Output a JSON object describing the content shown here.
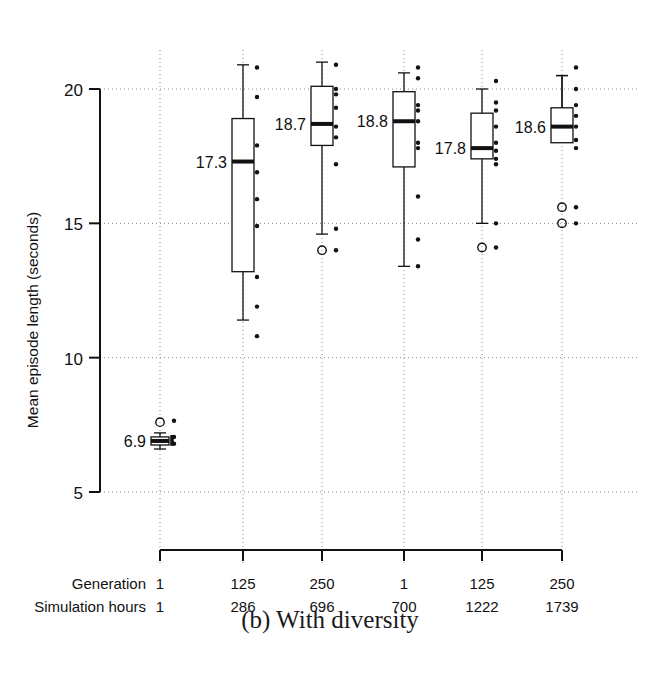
{
  "figure": {
    "caption": "(b) With diversity",
    "ylabel": "Mean episode length (seconds)",
    "row_labels": {
      "generation": "Generation",
      "sim_hours": "Simulation hours"
    },
    "colors": {
      "ink": "#111111",
      "grid": "#8c8c8c",
      "box_fill": "#ffffff"
    }
  },
  "chart_data": {
    "type": "box",
    "title": "(b) With diversity",
    "xlabel": "",
    "ylabel": "Mean episode length (seconds)",
    "ylim": [
      4.1,
      21.6
    ],
    "yticks": [
      5,
      10,
      15,
      20
    ],
    "ytick_labels": [
      "5",
      "10",
      "15",
      "20"
    ],
    "grid": "dotted horizontal at yticks, dotted vertical at group centers",
    "legend": "none",
    "categories": [
      "1",
      "125",
      "250",
      "1",
      "125",
      "250"
    ],
    "secondary_categories": [
      "1",
      "286",
      "696",
      "700",
      "1222",
      "1739"
    ],
    "median_labels": [
      "6.9",
      "17.3",
      "18.7",
      "18.8",
      "17.8",
      "18.6"
    ],
    "groups": [
      {
        "generation": "1",
        "simulation_hours": "1",
        "median": 6.9,
        "q1": 6.75,
        "q3": 7.05,
        "whisker_low": 6.6,
        "whisker_high": 7.2,
        "label": "6.9",
        "outliers": [
          7.6
        ],
        "points": [
          7.65,
          7.05,
          6.8
        ]
      },
      {
        "generation": "125",
        "simulation_hours": "286",
        "median": 17.3,
        "q1": 13.2,
        "q3": 18.9,
        "whisker_low": 11.4,
        "whisker_high": 20.9,
        "label": "17.3",
        "outliers": [],
        "points": [
          20.8,
          19.7,
          17.9,
          16.9,
          15.9,
          14.9,
          13.0,
          11.9,
          10.8
        ]
      },
      {
        "generation": "250",
        "simulation_hours": "696",
        "median": 18.7,
        "q1": 17.9,
        "q3": 20.1,
        "whisker_low": 14.6,
        "whisker_high": 21.0,
        "label": "18.7",
        "outliers": [
          14.0
        ],
        "points": [
          20.9,
          20.0,
          19.8,
          19.3,
          18.6,
          18.2,
          17.2,
          14.8,
          14.0
        ]
      },
      {
        "generation": "1",
        "simulation_hours": "700",
        "median": 18.8,
        "q1": 17.1,
        "q3": 19.9,
        "whisker_low": 13.4,
        "whisker_high": 20.6,
        "label": "18.8",
        "outliers": [],
        "points": [
          20.8,
          20.4,
          19.4,
          19.2,
          18.8,
          18.0,
          17.8,
          16.0,
          14.4,
          13.4
        ]
      },
      {
        "generation": "125",
        "simulation_hours": "1222",
        "median": 17.8,
        "q1": 17.4,
        "q3": 19.1,
        "whisker_low": 15.0,
        "whisker_high": 20.0,
        "label": "17.8",
        "outliers": [
          14.1
        ],
        "points": [
          20.3,
          19.5,
          19.2,
          18.6,
          18.0,
          17.7,
          17.4,
          17.2,
          15.0,
          14.1
        ]
      },
      {
        "generation": "250",
        "simulation_hours": "1739",
        "median": 18.6,
        "q1": 18.0,
        "q3": 19.3,
        "whisker_low": 20.5,
        "whisker_high": 20.5,
        "label": "18.6",
        "outliers": [
          15.6,
          15.0
        ],
        "points": [
          20.8,
          20.0,
          19.4,
          19.0,
          18.6,
          18.1,
          17.8,
          15.6,
          15.0
        ]
      }
    ]
  }
}
